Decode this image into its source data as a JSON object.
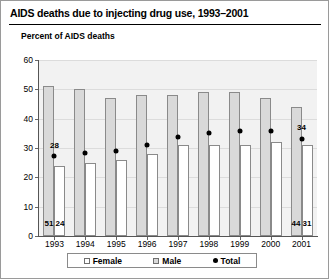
{
  "figure": {
    "title": "AIDS deaths due to injecting drug use, 1993–2001",
    "ylabel": "Percent of AIDS deaths"
  },
  "legend": {
    "items": [
      {
        "label": "Female",
        "marker": "open-square"
      },
      {
        "label": "Male",
        "marker": "filled-square"
      },
      {
        "label": "Total",
        "marker": "dot"
      }
    ]
  },
  "annotations": {
    "total_1993": "28",
    "total_2001": "34",
    "male_1993": "51",
    "female_1993": "24",
    "male_2001": "44",
    "female_2001": "31"
  },
  "colors": {
    "male_bar": "#d9d9d9",
    "female_bar": "#ffffff",
    "bar_outline": "#8a8a8a",
    "total_marker": "#000000",
    "plot_background": "#f2f2f2",
    "frame": "#9a9a9a"
  },
  "chart_data": {
    "type": "bar",
    "title": "AIDS deaths due to injecting drug use, 1993–2001",
    "xlabel": "",
    "ylabel": "Percent of AIDS deaths",
    "categories": [
      "1993",
      "1994",
      "1995",
      "1996",
      "1997",
      "1998",
      "1999",
      "2000",
      "2001"
    ],
    "ylim": [
      0,
      60
    ],
    "yticks": [
      0,
      10,
      20,
      30,
      40,
      50,
      60
    ],
    "grid": true,
    "legend_position": "bottom",
    "series": [
      {
        "name": "Male",
        "type": "bar",
        "values": [
          51,
          50,
          47,
          48,
          48,
          49,
          49,
          47,
          44
        ]
      },
      {
        "name": "Female",
        "type": "bar",
        "values": [
          24,
          25,
          26,
          28,
          31,
          31,
          31,
          32,
          31
        ]
      },
      {
        "name": "Total",
        "type": "marker",
        "values": [
          28,
          29,
          30,
          32,
          34.5,
          36,
          36.5,
          36.5,
          34
        ]
      }
    ],
    "data_labels": [
      {
        "series": "Total",
        "category": "1993",
        "text": "28"
      },
      {
        "series": "Total",
        "category": "2001",
        "text": "34"
      },
      {
        "series": "Male",
        "category": "1993",
        "text": "51"
      },
      {
        "series": "Female",
        "category": "1993",
        "text": "24"
      },
      {
        "series": "Male",
        "category": "2001",
        "text": "44"
      },
      {
        "series": "Female",
        "category": "2001",
        "text": "31"
      }
    ]
  }
}
